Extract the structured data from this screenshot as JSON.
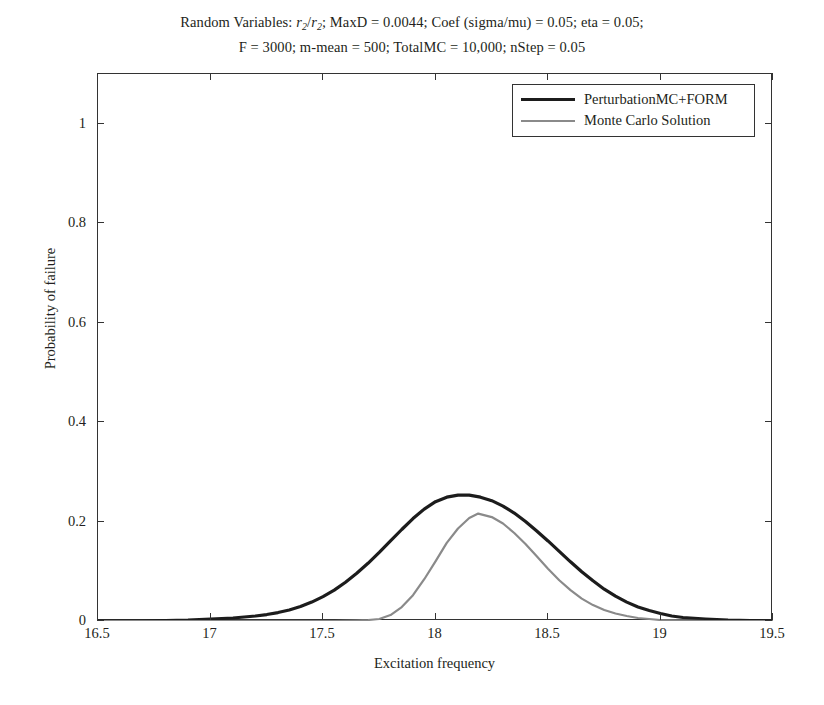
{
  "chart_data": {
    "type": "line",
    "title_lines": [
      "Random Variables: r2/r2; MaxD = 0.0044; Coef (sigma/mu) = 0.05; eta = 0.05;",
      "F = 3000; m-mean = 500; TotalMC = 10,000; nStep = 0.05"
    ],
    "title_line1_parts": {
      "a": "Random Variables: ",
      "var1": "r",
      "sub1": "2",
      "slash": "/",
      "var2": "r",
      "sub2": "2",
      "b": "; MaxD = 0.0044; Coef (sigma/mu) = 0.05; eta = 0.05;"
    },
    "xlabel": "Excitation frequency",
    "ylabel": "Probability of failure",
    "xlim": [
      16.5,
      19.5
    ],
    "ylim": [
      0,
      1.1
    ],
    "xticks": [
      16.5,
      17,
      17.5,
      18,
      18.5,
      19,
      19.5
    ],
    "xticklabels": [
      "16.5",
      "17",
      "17.5",
      "18",
      "18.5",
      "19",
      "19.5"
    ],
    "yticks": [
      0,
      0.2,
      0.4,
      0.6,
      0.8,
      1
    ],
    "yticklabels": [
      "0",
      "0.2",
      "0.4",
      "0.6",
      "0.8",
      "1"
    ],
    "grid": false,
    "legend_position": "upper right",
    "series": [
      {
        "name": "PerturbationMC+FORM",
        "color": "#1c1c1c",
        "width": 3.2,
        "x": [
          16.5,
          16.6,
          16.7,
          16.8,
          16.9,
          17.0,
          17.05,
          17.1,
          17.15,
          17.2,
          17.25,
          17.3,
          17.35,
          17.4,
          17.45,
          17.5,
          17.55,
          17.6,
          17.65,
          17.7,
          17.75,
          17.8,
          17.85,
          17.9,
          17.95,
          18.0,
          18.05,
          18.1,
          18.15,
          18.2,
          18.25,
          18.3,
          18.35,
          18.4,
          18.45,
          18.5,
          18.55,
          18.6,
          18.65,
          18.7,
          18.75,
          18.8,
          18.85,
          18.9,
          18.95,
          19.0,
          19.05,
          19.1,
          19.2,
          19.3,
          19.4,
          19.5
        ],
        "y": [
          0.0,
          0.0,
          0.0,
          0.001,
          0.002,
          0.004,
          0.005,
          0.006,
          0.008,
          0.01,
          0.013,
          0.017,
          0.022,
          0.029,
          0.038,
          0.049,
          0.062,
          0.078,
          0.096,
          0.116,
          0.138,
          0.161,
          0.184,
          0.206,
          0.225,
          0.24,
          0.249,
          0.253,
          0.253,
          0.249,
          0.242,
          0.231,
          0.217,
          0.2,
          0.181,
          0.161,
          0.14,
          0.119,
          0.099,
          0.081,
          0.064,
          0.05,
          0.038,
          0.028,
          0.021,
          0.015,
          0.01,
          0.007,
          0.004,
          0.002,
          0.001,
          0.0
        ]
      },
      {
        "name": "Monte Carlo Solution",
        "color": "#8a8a8a",
        "width": 2.2,
        "x": [
          16.5,
          16.8,
          17.0,
          17.2,
          17.4,
          17.55,
          17.65,
          17.7,
          17.75,
          17.8,
          17.85,
          17.9,
          17.95,
          18.0,
          18.05,
          18.1,
          18.15,
          18.19,
          18.25,
          18.3,
          18.35,
          18.4,
          18.45,
          18.5,
          18.55,
          18.6,
          18.65,
          18.7,
          18.75,
          18.8,
          18.85,
          18.9,
          18.95,
          19.0,
          19.1,
          19.2,
          19.3,
          19.4,
          19.5
        ],
        "y": [
          0.0,
          0.0,
          0.0,
          0.0,
          0.0,
          0.0,
          0.001,
          0.002,
          0.004,
          0.012,
          0.028,
          0.052,
          0.084,
          0.12,
          0.157,
          0.186,
          0.207,
          0.216,
          0.209,
          0.196,
          0.177,
          0.155,
          0.13,
          0.105,
          0.082,
          0.062,
          0.045,
          0.032,
          0.022,
          0.015,
          0.01,
          0.006,
          0.004,
          0.002,
          0.001,
          0.0,
          0.0,
          0.0,
          0.0
        ]
      }
    ]
  },
  "axes": {
    "x_title": "Excitation frequency",
    "y_title": "Probability of failure"
  }
}
